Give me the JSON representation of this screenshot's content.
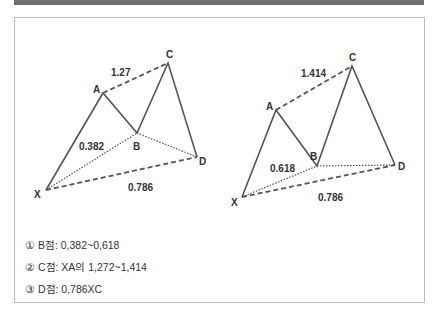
{
  "header": {
    "title": ""
  },
  "diagrams": [
    {
      "name": "left-pattern",
      "points": {
        "X": {
          "label": "X",
          "x": 46,
          "y": 190
        },
        "A": {
          "label": "A",
          "x": 103,
          "y": 93
        },
        "B": {
          "label": "B",
          "x": 137,
          "y": 133
        },
        "C": {
          "label": "C",
          "x": 168,
          "y": 63
        },
        "D": {
          "label": "D",
          "x": 197,
          "y": 157
        }
      },
      "ratios": {
        "AC": "1.27",
        "XB": "0.382",
        "XD": "0.786"
      }
    },
    {
      "name": "right-pattern",
      "points": {
        "X": {
          "label": "X",
          "x": 242,
          "y": 197
        },
        "A": {
          "label": "A",
          "x": 276,
          "y": 110
        },
        "B": {
          "label": "B",
          "x": 317,
          "y": 166
        },
        "C": {
          "label": "C",
          "x": 352,
          "y": 66
        },
        "D": {
          "label": "D",
          "x": 395,
          "y": 165
        }
      },
      "ratios": {
        "AC": "1.414",
        "XB": "0.618",
        "XD": "0.786"
      }
    }
  ],
  "notes": [
    "① B점: 0,382~0,618",
    "② C점: XA의 1,272~1,414",
    "③ D점: 0,786XC"
  ],
  "colors": {
    "line": "#555555",
    "text": "#333333",
    "bar": "#6e6e6e",
    "border": "#b8b8b8"
  }
}
